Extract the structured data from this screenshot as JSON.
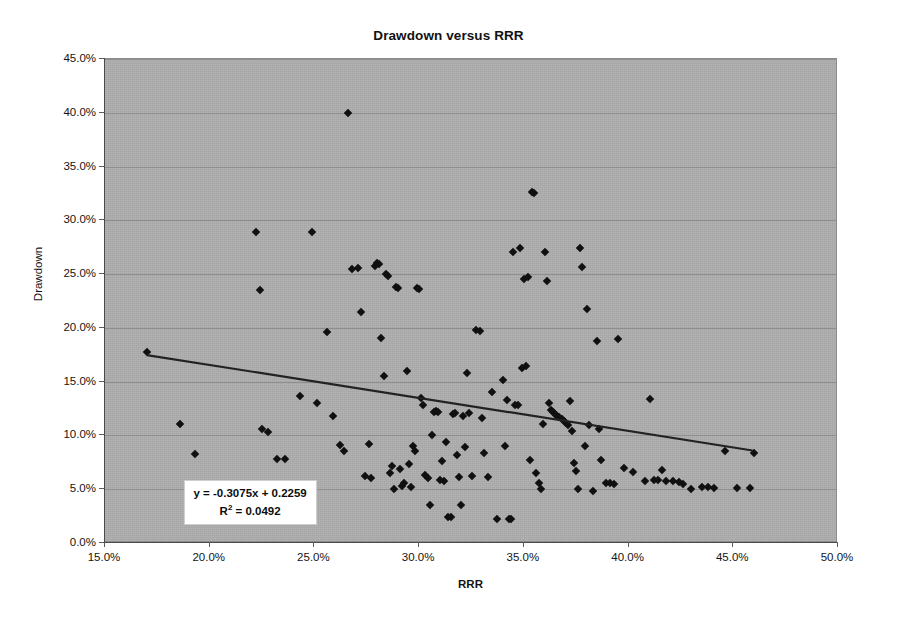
{
  "chart_data": {
    "type": "scatter",
    "title": "Drawdown versus RRR",
    "xlabel": "RRR",
    "ylabel": "Drawdown",
    "xlim": [
      0.15,
      0.5
    ],
    "ylim": [
      0.0,
      0.45
    ],
    "xticks": [
      "15.0%",
      "20.0%",
      "25.0%",
      "30.0%",
      "35.0%",
      "40.0%",
      "45.0%",
      "50.0%"
    ],
    "xtick_values": [
      0.15,
      0.2,
      0.25,
      0.3,
      0.35,
      0.4,
      0.45,
      0.5
    ],
    "yticks": [
      "0.0%",
      "5.0%",
      "10.0%",
      "15.0%",
      "20.0%",
      "25.0%",
      "30.0%",
      "35.0%",
      "40.0%",
      "45.0%"
    ],
    "ytick_values": [
      0.0,
      0.05,
      0.1,
      0.15,
      0.2,
      0.25,
      0.3,
      0.35,
      0.4,
      0.45
    ],
    "grid": true,
    "legend": "none",
    "plot_background": "#acacac",
    "marker_color": "#101010",
    "marker_shape": "diamond",
    "trendline": {
      "equation": "y = -0.3075x + 0.2259",
      "r_squared_label": "R",
      "r_squared_sup": "2",
      "r_squared_value": "= 0.0492",
      "slope": -0.3075,
      "intercept": 0.2259,
      "r_squared": 0.0492,
      "x_start": 0.17,
      "x_end": 0.46,
      "y_start": 0.1736,
      "y_end": 0.0845,
      "color": "#222222"
    },
    "points": [
      [
        0.17,
        0.178
      ],
      [
        0.186,
        0.111
      ],
      [
        0.193,
        0.083
      ],
      [
        0.222,
        0.289
      ],
      [
        0.224,
        0.235
      ],
      [
        0.225,
        0.106
      ],
      [
        0.228,
        0.103
      ],
      [
        0.232,
        0.078
      ],
      [
        0.236,
        0.078
      ],
      [
        0.243,
        0.137
      ],
      [
        0.249,
        0.289
      ],
      [
        0.251,
        0.13
      ],
      [
        0.256,
        0.196
      ],
      [
        0.259,
        0.118
      ],
      [
        0.262,
        0.091
      ],
      [
        0.264,
        0.086
      ],
      [
        0.266,
        0.4
      ],
      [
        0.268,
        0.255
      ],
      [
        0.271,
        0.256
      ],
      [
        0.272,
        0.215
      ],
      [
        0.274,
        0.062
      ],
      [
        0.276,
        0.092
      ],
      [
        0.277,
        0.06
      ],
      [
        0.279,
        0.258
      ],
      [
        0.28,
        0.26
      ],
      [
        0.281,
        0.259
      ],
      [
        0.282,
        0.191
      ],
      [
        0.283,
        0.155
      ],
      [
        0.284,
        0.25
      ],
      [
        0.285,
        0.248
      ],
      [
        0.286,
        0.065
      ],
      [
        0.287,
        0.072
      ],
      [
        0.288,
        0.05
      ],
      [
        0.289,
        0.238
      ],
      [
        0.29,
        0.237
      ],
      [
        0.291,
        0.069
      ],
      [
        0.292,
        0.053
      ],
      [
        0.293,
        0.056
      ],
      [
        0.294,
        0.16
      ],
      [
        0.295,
        0.073
      ],
      [
        0.296,
        0.052
      ],
      [
        0.297,
        0.09
      ],
      [
        0.298,
        0.086
      ],
      [
        0.299,
        0.237
      ],
      [
        0.3,
        0.236
      ],
      [
        0.301,
        0.135
      ],
      [
        0.302,
        0.128
      ],
      [
        0.303,
        0.063
      ],
      [
        0.304,
        0.06
      ],
      [
        0.305,
        0.035
      ],
      [
        0.306,
        0.1
      ],
      [
        0.307,
        0.122
      ],
      [
        0.308,
        0.123
      ],
      [
        0.309,
        0.122
      ],
      [
        0.31,
        0.059
      ],
      [
        0.311,
        0.076
      ],
      [
        0.312,
        0.058
      ],
      [
        0.313,
        0.094
      ],
      [
        0.314,
        0.024
      ],
      [
        0.315,
        0.024
      ],
      [
        0.316,
        0.12
      ],
      [
        0.317,
        0.121
      ],
      [
        0.318,
        0.082
      ],
      [
        0.319,
        0.061
      ],
      [
        0.32,
        0.035
      ],
      [
        0.321,
        0.118
      ],
      [
        0.322,
        0.089
      ],
      [
        0.323,
        0.158
      ],
      [
        0.324,
        0.121
      ],
      [
        0.325,
        0.062
      ],
      [
        0.327,
        0.198
      ],
      [
        0.329,
        0.197
      ],
      [
        0.33,
        0.116
      ],
      [
        0.331,
        0.084
      ],
      [
        0.333,
        0.061
      ],
      [
        0.335,
        0.14
      ],
      [
        0.337,
        0.022
      ],
      [
        0.34,
        0.152
      ],
      [
        0.341,
        0.09
      ],
      [
        0.342,
        0.133
      ],
      [
        0.343,
        0.022
      ],
      [
        0.344,
        0.022
      ],
      [
        0.345,
        0.271
      ],
      [
        0.346,
        0.128
      ],
      [
        0.347,
        0.128
      ],
      [
        0.348,
        0.274
      ],
      [
        0.349,
        0.163
      ],
      [
        0.35,
        0.245
      ],
      [
        0.351,
        0.165
      ],
      [
        0.352,
        0.247
      ],
      [
        0.353,
        0.077
      ],
      [
        0.354,
        0.326
      ],
      [
        0.355,
        0.325
      ],
      [
        0.356,
        0.065
      ],
      [
        0.357,
        0.056
      ],
      [
        0.358,
        0.05
      ],
      [
        0.359,
        0.111
      ],
      [
        0.36,
        0.271
      ],
      [
        0.361,
        0.244
      ],
      [
        0.362,
        0.13
      ],
      [
        0.363,
        0.124
      ],
      [
        0.364,
        0.122
      ],
      [
        0.365,
        0.12
      ],
      [
        0.366,
        0.118
      ],
      [
        0.367,
        0.117
      ],
      [
        0.368,
        0.115
      ],
      [
        0.369,
        0.113
      ],
      [
        0.37,
        0.112
      ],
      [
        0.371,
        0.11
      ],
      [
        0.372,
        0.132
      ],
      [
        0.373,
        0.104
      ],
      [
        0.374,
        0.074
      ],
      [
        0.375,
        0.067
      ],
      [
        0.376,
        0.05
      ],
      [
        0.377,
        0.274
      ],
      [
        0.378,
        0.257
      ],
      [
        0.379,
        0.09
      ],
      [
        0.38,
        0.218
      ],
      [
        0.381,
        0.11
      ],
      [
        0.383,
        0.048
      ],
      [
        0.385,
        0.188
      ],
      [
        0.386,
        0.106
      ],
      [
        0.387,
        0.077
      ],
      [
        0.389,
        0.056
      ],
      [
        0.391,
        0.056
      ],
      [
        0.393,
        0.055
      ],
      [
        0.395,
        0.19
      ],
      [
        0.398,
        0.07
      ],
      [
        0.402,
        0.066
      ],
      [
        0.408,
        0.058
      ],
      [
        0.41,
        0.134
      ],
      [
        0.412,
        0.059
      ],
      [
        0.414,
        0.059
      ],
      [
        0.416,
        0.068
      ],
      [
        0.418,
        0.058
      ],
      [
        0.421,
        0.058
      ],
      [
        0.424,
        0.057
      ],
      [
        0.426,
        0.055
      ],
      [
        0.43,
        0.05
      ],
      [
        0.435,
        0.052
      ],
      [
        0.438,
        0.052
      ],
      [
        0.441,
        0.051
      ],
      [
        0.446,
        0.086
      ],
      [
        0.452,
        0.051
      ],
      [
        0.458,
        0.051
      ],
      [
        0.46,
        0.084
      ]
    ]
  }
}
